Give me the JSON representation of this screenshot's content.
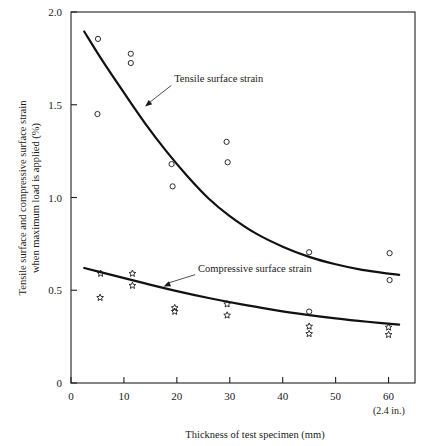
{
  "figure": {
    "title": "",
    "footer_caption": "Thickness of test specimen (mm)",
    "secondary_tick_note": "(2.4 in.)"
  },
  "chart_data": {
    "type": "scatter",
    "title": "",
    "xlabel": "Thickness of test specimen (mm)",
    "ylabel": "Tensile surface and compressive surface strain when maximum load is applied (%)",
    "xlim": [
      0,
      65
    ],
    "ylim": [
      0,
      2.0
    ],
    "xticks": [
      0,
      10,
      20,
      30,
      40,
      50,
      60
    ],
    "xticklabels": [
      "0",
      "10",
      "20",
      "30",
      "40",
      "50",
      "60"
    ],
    "yticks": [
      0,
      0.5,
      1.0,
      1.5,
      2.0
    ],
    "yticklabels": [
      "0",
      "0.5",
      "1.0",
      "1.5",
      "2.0"
    ],
    "grid": false,
    "legend_position": "inline-annotations",
    "annotations": [
      {
        "text": "Tensile surface strain",
        "text_x": 19.5,
        "text_y": 1.62,
        "arrow_to_x": 14.0,
        "arrow_to_y": 1.49
      },
      {
        "text": "Compressive surface strain",
        "text_x": 24.0,
        "text_y": 0.6,
        "arrow_to_x": 17.5,
        "arrow_to_y": 0.52
      }
    ],
    "series": [
      {
        "name": "Tensile surface strain",
        "marker": "open-circle",
        "marker_color": "#2b2b2b",
        "points": [
          {
            "x": 5.0,
            "y": 1.45
          },
          {
            "x": 5.1,
            "y": 1.855
          },
          {
            "x": 11.3,
            "y": 1.775
          },
          {
            "x": 11.3,
            "y": 1.725
          },
          {
            "x": 19.0,
            "y": 1.18
          },
          {
            "x": 19.2,
            "y": 1.06
          },
          {
            "x": 29.4,
            "y": 1.3
          },
          {
            "x": 29.6,
            "y": 1.19
          },
          {
            "x": 45.0,
            "y": 0.705
          },
          {
            "x": 45.0,
            "y": 0.385
          },
          {
            "x": 60.2,
            "y": 0.7
          },
          {
            "x": 60.2,
            "y": 0.555
          }
        ]
      },
      {
        "name": "Compressive surface strain",
        "marker": "open-star",
        "marker_color": "#1a1a1a",
        "points": [
          {
            "x": 5.6,
            "y": 0.59
          },
          {
            "x": 5.5,
            "y": 0.46
          },
          {
            "x": 11.6,
            "y": 0.59
          },
          {
            "x": 11.6,
            "y": 0.525
          },
          {
            "x": 19.6,
            "y": 0.405
          },
          {
            "x": 19.6,
            "y": 0.385
          },
          {
            "x": 29.5,
            "y": 0.425
          },
          {
            "x": 29.5,
            "y": 0.365
          },
          {
            "x": 45.0,
            "y": 0.305
          },
          {
            "x": 45.0,
            "y": 0.265
          },
          {
            "x": 60.0,
            "y": 0.3
          },
          {
            "x": 60.0,
            "y": 0.26
          }
        ]
      }
    ],
    "fitted_curves": [
      {
        "name": "Tensile surface strain fit",
        "x": [
          2.5,
          6,
          10,
          14,
          18,
          22,
          26,
          30,
          35,
          40,
          45,
          50,
          55,
          60,
          62
        ],
        "y": [
          1.895,
          1.735,
          1.565,
          1.4,
          1.25,
          1.115,
          0.995,
          0.9,
          0.805,
          0.735,
          0.68,
          0.64,
          0.61,
          0.59,
          0.583
        ]
      },
      {
        "name": "Compressive surface strain fit",
        "x": [
          2.5,
          8,
          14,
          20,
          26,
          32,
          38,
          44,
          50,
          56,
          62
        ],
        "y": [
          0.62,
          0.58,
          0.537,
          0.495,
          0.458,
          0.425,
          0.396,
          0.37,
          0.348,
          0.33,
          0.315
        ]
      }
    ]
  }
}
